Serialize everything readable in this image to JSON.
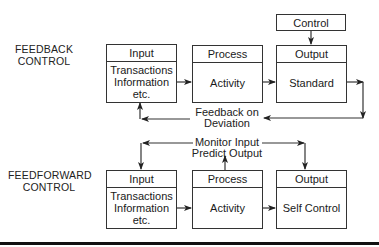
{
  "diagram": {
    "feedback": {
      "label_line1": "FEEDBACK",
      "label_line2": "CONTROL",
      "control_box": "Control",
      "input": {
        "header": "Input",
        "body": [
          "Transactions",
          "Information",
          "etc."
        ]
      },
      "process": {
        "header": "Process",
        "body": "Activity"
      },
      "output": {
        "header": "Output",
        "body": "Standard"
      },
      "loop_label_line1": "Feedback on",
      "loop_label_line2": "Deviation"
    },
    "feedforward": {
      "label_line1": "FEEDFORWARD",
      "label_line2": "CONTROL",
      "input": {
        "header": "Input",
        "body": [
          "Transactions",
          "Information",
          "etc."
        ]
      },
      "process": {
        "header": "Process",
        "body": "Activity"
      },
      "output": {
        "header": "Output",
        "body": "Self Control"
      },
      "loop_label_line1": "Monitor Input",
      "loop_label_line2": "Predict Output"
    },
    "colors": {
      "line": "#333333",
      "text": "#1a1a1a",
      "background": "#ffffff"
    }
  }
}
